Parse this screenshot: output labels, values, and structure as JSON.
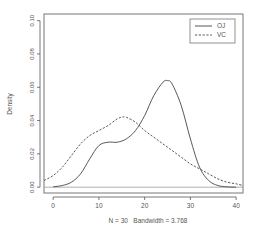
{
  "chart_data": {
    "type": "line",
    "title": "",
    "xlabel": "N = 30   Bandwidth = 3.768",
    "ylabel": "Density",
    "xlim": [
      -2,
      41.5
    ],
    "ylim": [
      -0.0035,
      0.104
    ],
    "x_ticks": [
      0,
      10,
      20,
      30,
      40
    ],
    "x_tick_labels": [
      "0",
      "10",
      "20",
      "30",
      "40"
    ],
    "y_ticks": [
      0.0,
      0.02,
      0.04,
      0.06,
      0.08,
      0.1
    ],
    "y_tick_labels": [
      "0.00",
      "0.02",
      "0.04",
      "0.06",
      "0.08",
      "0.10"
    ],
    "grid": false,
    "baseline": 0,
    "legend": {
      "position": "top-right",
      "entries": [
        "OJ",
        "VC"
      ]
    },
    "series": [
      {
        "name": "OJ",
        "style": "solid",
        "x": [
          0,
          2,
          4,
          6,
          8,
          10,
          12,
          14,
          16,
          18,
          20,
          22,
          24,
          25,
          26,
          28,
          30,
          32,
          34,
          36,
          38,
          40
        ],
        "y": [
          0.0002,
          0.001,
          0.003,
          0.008,
          0.017,
          0.025,
          0.027,
          0.027,
          0.029,
          0.034,
          0.043,
          0.055,
          0.063,
          0.064,
          0.062,
          0.049,
          0.029,
          0.012,
          0.004,
          0.001,
          0.0002,
          0.0
        ]
      },
      {
        "name": "VC",
        "style": "dashed",
        "x": [
          -2,
          0,
          2,
          4,
          6,
          8,
          10,
          12,
          14,
          15,
          16,
          18,
          20,
          22,
          24,
          26,
          28,
          30,
          32,
          34,
          36,
          38,
          40,
          41.5
        ],
        "y": [
          0.004,
          0.007,
          0.012,
          0.019,
          0.026,
          0.031,
          0.034,
          0.037,
          0.041,
          0.042,
          0.042,
          0.039,
          0.034,
          0.03,
          0.026,
          0.022,
          0.018,
          0.014,
          0.011,
          0.008,
          0.005,
          0.003,
          0.002,
          0.001
        ]
      }
    ]
  }
}
